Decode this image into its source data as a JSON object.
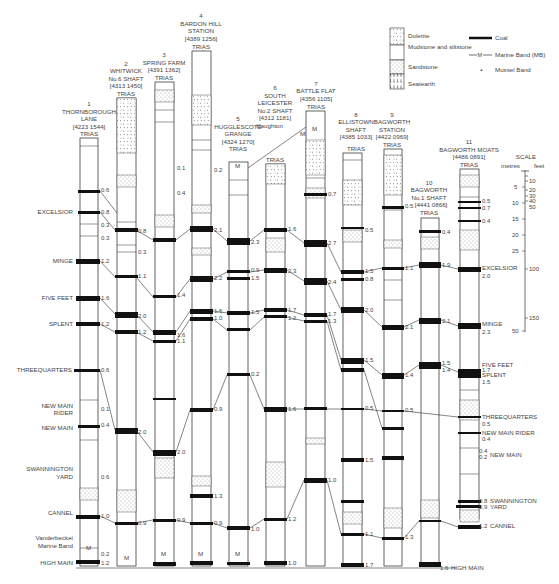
{
  "legend": {
    "lithology": [
      {
        "name": "Dolerite",
        "pattern": "dolerite"
      },
      {
        "name": "Mudstone and siltstone",
        "pattern": "mudstone"
      },
      {
        "name": "Sandstone",
        "pattern": "sandstone"
      },
      {
        "name": "Seatearth",
        "pattern": "seatearth"
      }
    ],
    "symbols": [
      {
        "name": "Coal",
        "symbol": "thick-line"
      },
      {
        "name": "Marine Band (MB)",
        "symbol": "M-line"
      },
      {
        "name": "Mussel Band",
        "symbol": "shell"
      }
    ]
  },
  "scale": {
    "title": "SCALE",
    "units_left": "metres",
    "units_right": "feet",
    "metres_ticks": [
      "5",
      "10",
      "15",
      "20",
      "25",
      "50"
    ],
    "feet_ticks": [
      "10",
      "20",
      "30",
      "40",
      "50",
      "100",
      "150"
    ]
  },
  "columns": [
    {
      "n": "1",
      "name": [
        "THORNBOROUGH",
        "LANE"
      ],
      "grid": "[4223 1544]",
      "top": "TRIAS",
      "x": 248
    },
    {
      "n": "2",
      "name": [
        "WHITWICK",
        "No.6 SHAFT"
      ],
      "grid": "[4313 1450]",
      "top": "TRIAS",
      "x": 126
    },
    {
      "n": "3",
      "name": [
        "SPRING FARM"
      ],
      "grid": "[4391 1362]",
      "top": "TRIAS",
      "x": 164
    },
    {
      "n": "4",
      "name": [
        "BARDON HILL",
        "STATION"
      ],
      "grid": "[4389 1256]",
      "top": "TRIAS",
      "x": 201
    },
    {
      "n": "5",
      "name": [
        "HUGGLESCOTE",
        "GRANGE"
      ],
      "grid": "[4324 1270]",
      "top": "TRIAS",
      "x": 238
    },
    {
      "n": "6",
      "name": [
        "SOUTH",
        "LEICESTER",
        "No.2 SHAFT"
      ],
      "grid": "[4312 1181]",
      "top": "TRIAS",
      "x": 275
    },
    {
      "n": "7",
      "name": [
        "BATTLE FLAT"
      ],
      "grid": "[4356 1105]",
      "top": "TRIAS",
      "x": 316
    },
    {
      "n": "8",
      "name": [
        "ELLISTOWN",
        "SHAFT"
      ],
      "grid": "[4385 1033]",
      "top": "TRIAS",
      "x": 356
    },
    {
      "n": "9",
      "name": [
        "BAGWORTH",
        "STATION"
      ],
      "grid": "[4422 0969]",
      "top": "TRIAS",
      "x": 390
    },
    {
      "n": "10",
      "name": [
        "BAGWORTH",
        "No.1 SHAFT"
      ],
      "grid": "[4441 0866]",
      "top": "TRIAS",
      "x": 430
    },
    {
      "n": "11",
      "name": [
        "BAGWORTH MOATS"
      ],
      "grid": "[4486 0891]",
      "top": "TRIAS",
      "x": 468
    }
  ],
  "annotations": {
    "haughton": [
      "Haughton",
      "MB"
    ],
    "vanderbecke": [
      "Vanderbeckei",
      "Marine Band"
    ]
  },
  "seams_left": [
    "EXCELSIOR",
    "MINGE",
    "FIVE FEET",
    "SPLENT",
    "THREEQUARTERS",
    "NEW MAIN RIDER",
    "NEW MAIN",
    "SWANNINGTON YARD",
    "CANNEL",
    "HIGH MAIN"
  ],
  "seams_right": [
    {
      "name": "EXCELSIOR",
      "value": "2.0"
    },
    {
      "name": "MINGE",
      "value": "2.3"
    },
    {
      "name": "FIVE FEET",
      "value": "1.7"
    },
    {
      "name": "SPLENT",
      "value": "1.5"
    },
    {
      "name": "THREEQUARTERS",
      "value": "0.5"
    },
    {
      "name": "NEW MAIN RIDER",
      "value": "0.4"
    },
    {
      "name": "NEW MAIN",
      "value": "0.4 / 0.2"
    },
    {
      "name": "SWANNINGTON YARD",
      "value": "0.8 / 0.9"
    },
    {
      "name": "CANNEL",
      "value": "1.2"
    },
    {
      "name": "HIGH MAIN",
      "value": "1.6"
    }
  ],
  "thickness_values": {
    "col1": [
      "0.6",
      "0.8",
      "0.3",
      "0.3",
      "1.2",
      "1.6",
      "1.2",
      "0.6",
      "0.1",
      "0.4",
      "0.1",
      "0.4",
      "0.6",
      "1.0",
      "0.2",
      "1.2"
    ],
    "col2": [
      "0.8",
      "0.6",
      "0.3",
      "0.3",
      "1.1",
      "2.0",
      "1.2",
      "0.6",
      "0.6",
      "2.0",
      "0.6",
      "0.9",
      "0.6"
    ],
    "col3": [
      "0.1",
      "0.4",
      "0.3",
      "0.3",
      "1.4",
      "1.6",
      "1.1",
      "0.6",
      "0.2",
      "2.0",
      "0.7",
      "0.9"
    ],
    "col4": [
      "0.2",
      "0.3",
      "0.17",
      "2.1",
      "2.2",
      "1.6",
      "1.0",
      "0.4",
      "0.1",
      "0.9",
      "1.3",
      "0.9"
    ],
    "col5": [
      "0.1",
      "0.1",
      "2.3",
      "0.9",
      "1.5",
      "1.5",
      "1.1",
      "0.2",
      "0.1",
      "0.8",
      "1.0",
      "0.3",
      "0.3"
    ],
    "col6": [
      "0.2",
      "1.6",
      "0.5",
      "2.3",
      "1.7",
      "1.2",
      "0.3",
      "1.6",
      "1.2",
      "0.2",
      "1.0"
    ],
    "col7": [
      "0.7",
      "2.7",
      "2.4",
      "1.7",
      "1.3",
      "0.1",
      "0.1",
      "1.1",
      "1.0"
    ],
    "col8": [
      "0.5",
      "1.5",
      "0.8",
      "2.0",
      "1.5",
      "1.4",
      "0.5",
      "0.3",
      "1.5",
      "1.0",
      "1.1",
      "1.7"
    ],
    "col9": [
      "0.5",
      "0.3",
      "1.1",
      "2.1",
      "1.4",
      "1.6",
      "0.5",
      "0.3",
      "1.4",
      "0.5",
      "1.3"
    ],
    "col10": [
      "0.4",
      "1.9",
      "2.1",
      "1.5",
      "1.4"
    ],
    "col11": [
      "0.5",
      "0.7",
      "0.4"
    ]
  },
  "style": {
    "ink": "#222222",
    "bg": "#ffffff",
    "coal": "#111111"
  }
}
